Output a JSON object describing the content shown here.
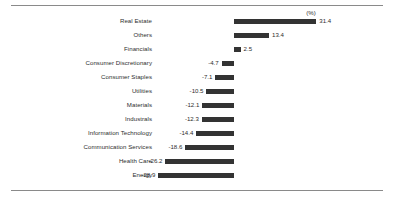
{
  "figure": {
    "unit_annotation": "(%)",
    "bar_color": "#333333",
    "text_color": "#2e2e2e",
    "rule_color": "#8a8a8a",
    "background": "#ffffff"
  },
  "chart_data": {
    "type": "bar",
    "orientation": "horizontal",
    "title": "",
    "subtitle": "",
    "xlabel": "",
    "ylabel": "",
    "unit": "(%)",
    "grid": false,
    "legend": "none",
    "zero_baseline": true,
    "xlim": [
      -28.9,
      31.4
    ],
    "categories": [
      "Real Estate",
      "Others",
      "Financials",
      "Consumer Discretionary",
      "Consumer Staples",
      "Utilities",
      "Materials",
      "Industrals",
      "Information Technology",
      "Communication Services",
      "Health Care",
      "Energy"
    ],
    "values": [
      31.4,
      13.4,
      2.5,
      -4.7,
      -7.1,
      -10.5,
      -12.1,
      -12.3,
      -14.4,
      -18.6,
      -26.2,
      -28.9
    ],
    "value_labels": [
      "31.4",
      "13.4",
      "2.5",
      "-4.7",
      "-7.1",
      "-10.5",
      "-12.1",
      "-12.3",
      "-14.4",
      "-18.6",
      "-26.2",
      "-28.9"
    ]
  }
}
